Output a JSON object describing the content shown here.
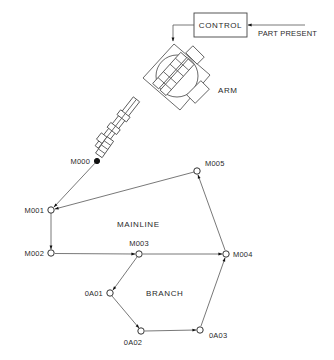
{
  "control": {
    "label": "CONTROL",
    "input_label": "PART PRESENT"
  },
  "arm": {
    "label": "ARM"
  },
  "regions": {
    "mainline": "MAINLINE",
    "branch": "BRANCH"
  },
  "nodes": {
    "M000": {
      "label": "M000",
      "x": 97,
      "y": 161,
      "style": "solid"
    },
    "M001": {
      "label": "M001",
      "x": 51,
      "y": 210,
      "style": "open"
    },
    "M002": {
      "label": "M002",
      "x": 51,
      "y": 253,
      "style": "open"
    },
    "M003": {
      "label": "M003",
      "x": 139,
      "y": 254,
      "style": "open"
    },
    "M004": {
      "label": "M004",
      "x": 226,
      "y": 254,
      "style": "open"
    },
    "M005": {
      "label": "M005",
      "x": 197,
      "y": 171,
      "style": "open"
    },
    "0A01": {
      "label": "0A01",
      "x": 110,
      "y": 293,
      "style": "open"
    },
    "0A02": {
      "label": "0A02",
      "x": 141,
      "y": 331,
      "style": "open"
    },
    "0A03": {
      "label": "0A03",
      "x": 200,
      "y": 330,
      "style": "open"
    }
  },
  "edges": [
    {
      "from": "M000",
      "to": "M001"
    },
    {
      "from": "M005",
      "to": "M001"
    },
    {
      "from": "M001",
      "to": "M002"
    },
    {
      "from": "M002",
      "to": "M003"
    },
    {
      "from": "M003",
      "to": "M004"
    },
    {
      "from": "M004",
      "to": "M005"
    },
    {
      "from": "M003",
      "to": "0A01"
    },
    {
      "from": "0A01",
      "to": "0A02"
    },
    {
      "from": "0A02",
      "to": "0A03"
    },
    {
      "from": "0A03",
      "to": "M004"
    }
  ]
}
